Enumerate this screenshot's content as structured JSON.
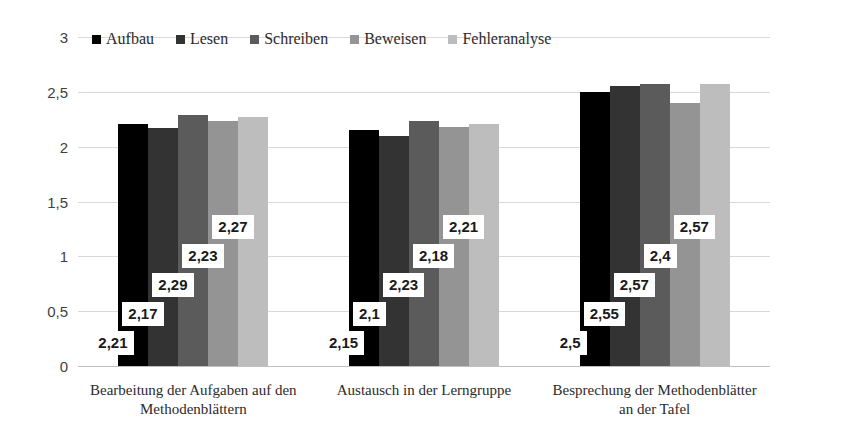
{
  "chart_data": {
    "type": "bar",
    "title": "",
    "subtitle": "",
    "xlabel": "",
    "ylabel": "",
    "ylim": [
      0,
      3
    ],
    "ytick_labels": [
      "3",
      "2,5",
      "2",
      "1,5",
      "1",
      "0,5",
      "0"
    ],
    "ytick_values": [
      3,
      2.5,
      2,
      1.5,
      1,
      0.5,
      0
    ],
    "grid": true,
    "legend_position": "top",
    "decimal_separator": ",",
    "categories": [
      "Bearbeitung der Aufgaben auf den Methodenblättern",
      "Austausch in der Lerngruppe",
      "Besprechung der Methodenblätter an der Tafel"
    ],
    "category_lines": [
      [
        "Bearbeitung der Aufgaben auf den",
        "Methodenblättern"
      ],
      [
        "Austausch in der Lerngruppe"
      ],
      [
        "Besprechung der Methodenblätter",
        "an der Tafel"
      ]
    ],
    "series": [
      {
        "name": "Aufbau",
        "color": "#000000",
        "values": [
          2.21,
          2.15,
          2.5
        ],
        "labels": [
          "2,21",
          "2,15",
          "2,5"
        ]
      },
      {
        "name": "Lesen",
        "color": "#333333",
        "values": [
          2.17,
          2.1,
          2.55
        ],
        "labels": [
          "2,17",
          "2,1",
          "2,55"
        ]
      },
      {
        "name": "Schreiben",
        "color": "#5b5b5b",
        "values": [
          2.29,
          2.23,
          2.57
        ],
        "labels": [
          "2,29",
          "2,23",
          "2,57"
        ]
      },
      {
        "name": "Beweisen",
        "color": "#949494",
        "values": [
          2.23,
          2.18,
          2.4
        ],
        "labels": [
          "2,23",
          "2,18",
          "2,4"
        ]
      },
      {
        "name": "Fehleranalyse",
        "color": "#bdbdbd",
        "values": [
          2.27,
          2.21,
          2.57
        ],
        "labels": [
          "2,27",
          "2,21",
          "2,57"
        ]
      }
    ]
  },
  "legend": {
    "items": [
      {
        "label": "Aufbau",
        "color": "#000000"
      },
      {
        "label": "Lesen",
        "color": "#333333"
      },
      {
        "label": "Schreiben",
        "color": "#5b5b5b"
      },
      {
        "label": "Beweisen",
        "color": "#949494"
      },
      {
        "label": "Fehleranalyse",
        "color": "#bdbdbd"
      }
    ]
  },
  "colors": {
    "background": "#ffffff",
    "gridline": "#d9d9d9",
    "axis_text": "#3f3f3f",
    "label_text": "#1a1a1a",
    "category_text": "#2b2b2b"
  }
}
